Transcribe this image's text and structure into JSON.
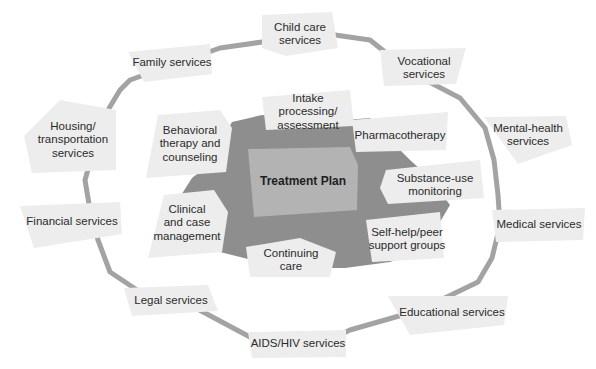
{
  "diagram": {
    "center": {
      "label": "Treatment Plan"
    },
    "inner_components": [
      {
        "id": "intake",
        "label": "Intake\nprocessing/\nassessment"
      },
      {
        "id": "pharmacotherapy",
        "label": "Pharmacotherapy"
      },
      {
        "id": "substance-use",
        "label": "Substance-use\nmonitoring"
      },
      {
        "id": "self-help",
        "label": "Self-help/peer\nsupport groups"
      },
      {
        "id": "continuing-care",
        "label": "Continuing\ncare"
      },
      {
        "id": "clinical",
        "label": "Clinical\nand case\nmanagement"
      },
      {
        "id": "behavioral",
        "label": "Behavioral\ntherapy and\ncounseling"
      }
    ],
    "outer_services": [
      {
        "id": "child-care",
        "label": "Child care\nservices"
      },
      {
        "id": "vocational",
        "label": "Vocational\nservices"
      },
      {
        "id": "mental-health",
        "label": "Mental-health\nservices"
      },
      {
        "id": "medical",
        "label": "Medical services"
      },
      {
        "id": "educational",
        "label": "Educational services"
      },
      {
        "id": "aids-hiv",
        "label": "AIDS/HIV services"
      },
      {
        "id": "legal",
        "label": "Legal services"
      },
      {
        "id": "financial",
        "label": "Financial services"
      },
      {
        "id": "housing",
        "label": "Housing/\ntransportation\nservices"
      },
      {
        "id": "family",
        "label": "Family services"
      }
    ],
    "colors": {
      "ring": "#a3a3a3",
      "core_blob": "#8e8e8e",
      "center_box": "#b3b3b3",
      "label_box": "#ededed",
      "text": "#2b2b2b"
    }
  }
}
